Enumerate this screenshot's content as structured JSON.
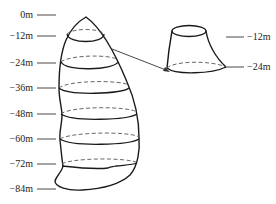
{
  "diagram": {
    "depth_scale": {
      "labels": [
        "0m",
        "−12m",
        "−24m",
        "−36m",
        "−48m",
        "−60m",
        "−72m",
        "−84m"
      ]
    },
    "extracted_slice": {
      "top_label": "−12m",
      "bottom_label": "−24m"
    },
    "colors": {
      "line": "#1a1a1a",
      "dashed": "#555555",
      "background": "#ffffff"
    }
  }
}
